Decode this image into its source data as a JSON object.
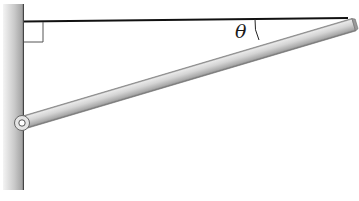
{
  "diagram": {
    "title": "",
    "labels": {
      "angle": "θ"
    },
    "elements": {
      "wall": {
        "description": "vertical wall",
        "color_light": "#f2f2f2",
        "color_dark": "#8a8a8a"
      },
      "cable": {
        "description": "horizontal cable from wall to end of boom",
        "color": "#111111"
      },
      "right_angle_marker": {
        "description": "right angle between wall and cable"
      },
      "boom": {
        "description": "uniform rod hinged at wall, angled upward",
        "color": "#c8c8c8"
      },
      "hinge": {
        "description": "pin joint at wall"
      },
      "angle_arc": {
        "description": "angle θ between cable and boom"
      }
    },
    "colors": {
      "background": "#ffffff",
      "line": "#111111",
      "rod_light": "#e6e6e6",
      "rod_mid": "#c4c4c4",
      "rod_dark": "#7d7d7d"
    }
  }
}
